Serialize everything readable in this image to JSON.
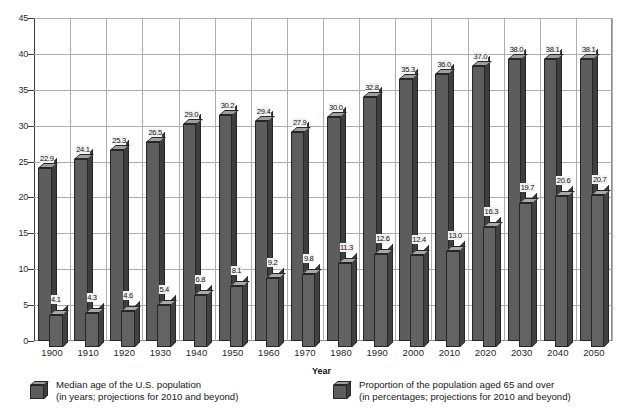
{
  "chart_data": {
    "type": "bar",
    "title": "",
    "xlabel": "Year",
    "ylabel": "",
    "ylim": [
      0,
      45
    ],
    "ytick_step": 5,
    "yticks": [
      45,
      40,
      35,
      30,
      25,
      20,
      15,
      10,
      5,
      0
    ],
    "grid": true,
    "legend_position": "bottom",
    "categories": [
      "1900",
      "1910",
      "1920",
      "1930",
      "1940",
      "1950",
      "1960",
      "1970",
      "1980",
      "1990",
      "2000",
      "2010",
      "2020",
      "2030",
      "2040",
      "2050"
    ],
    "series": [
      {
        "name": "Median age of the U.S. population",
        "sublabel": "(in years; projections for 2010 and beyond)",
        "color": "#5d5d5d",
        "values": [
          22.9,
          24.1,
          25.3,
          26.5,
          29.0,
          30.2,
          29.4,
          27.9,
          30.0,
          32.8,
          35.3,
          36.0,
          37.0,
          38.0,
          38.1,
          38.1
        ],
        "labels": [
          "22.9",
          "24.1",
          "25.3",
          "26.5",
          "29.0",
          "30.2",
          "29.4",
          "27.9",
          "30.0",
          "32.8",
          "35.3",
          "36.0",
          "37.0",
          "38.0",
          "38.1",
          "38.1"
        ]
      },
      {
        "name": "Proportion of the population aged 65 and over",
        "sublabel": "(in percentages; projections for 2010 and beyond)",
        "color": "#636363",
        "values": [
          4.1,
          4.3,
          4.6,
          5.4,
          6.8,
          8.1,
          9.2,
          9.8,
          11.3,
          12.6,
          12.4,
          13.0,
          16.3,
          19.7,
          20.6,
          20.7
        ],
        "labels": [
          "4.1",
          "4.3",
          "4.6",
          "5.4",
          "6.8",
          "8.1",
          "9.2",
          "9.8",
          "11.3",
          "12.6",
          "12.4",
          "13.0",
          "16.3",
          "19.7",
          "20.6",
          "20.7"
        ]
      }
    ]
  },
  "legend": {
    "items": [
      {
        "line1": "Median age of the U.S. population",
        "line2": "(in years; projections for 2010 and beyond)",
        "icon": "cube-swatch-icon"
      },
      {
        "line1": "Proportion of the population aged 65 and over",
        "line2": "(in percentages; projections for 2010 and beyond)",
        "icon": "cube-swatch-icon"
      }
    ]
  },
  "axis": {
    "x_title": "Year"
  }
}
